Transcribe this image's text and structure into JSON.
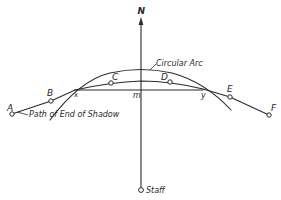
{
  "diagram": {
    "title_label": "N",
    "arc_label": "Circular Arc",
    "path_label": "Path of End of Shadow",
    "staff_label": "Staff",
    "points": {
      "A": "A",
      "B": "B",
      "C": "C",
      "D": "D",
      "E": "E",
      "F": "F"
    },
    "intersections": {
      "x": "x",
      "y": "y",
      "m": "m"
    },
    "colors": {
      "line": "#2a2a2a",
      "background": "#ffffff"
    }
  }
}
